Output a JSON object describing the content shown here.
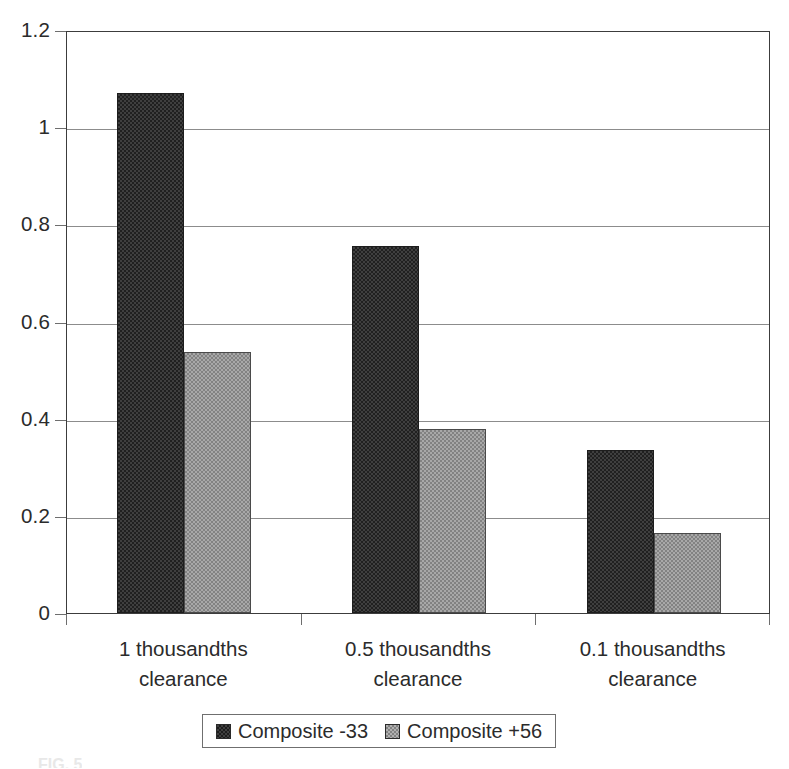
{
  "chart_data": {
    "type": "bar",
    "title": "",
    "subtitle": "",
    "xlabel": "",
    "ylabel": "",
    "categories": [
      "1 thousandths clearance",
      "0.5 thousandths clearance",
      "0.1 thousandths clearance"
    ],
    "category_lines": [
      [
        "1 thousandths",
        "clearance"
      ],
      [
        "0.5 thousandths",
        "clearance"
      ],
      [
        "0.1 thousandths",
        "clearance"
      ]
    ],
    "series": [
      {
        "name": "Composite -33",
        "values": [
          1.07,
          0.755,
          0.335
        ],
        "color": "#3f3f3f",
        "pattern": "dark-checker"
      },
      {
        "name": "Composite +56",
        "values": [
          0.538,
          0.378,
          0.165
        ],
        "color": "#a8a8a8",
        "pattern": "light-checker"
      }
    ],
    "ylim": [
      0,
      1.2
    ],
    "yticks": [
      0,
      0.2,
      0.4,
      0.6,
      0.8,
      1,
      1.2
    ],
    "ytick_labels": [
      "0",
      "0.2",
      "0.4",
      "0.6",
      "0.8",
      "1",
      "1.2"
    ],
    "grid": true,
    "grid_axis": "y",
    "legend_position": "bottom",
    "frame": true
  },
  "legend": {
    "entries": [
      {
        "label": "Composite -33",
        "swatch": "dark"
      },
      {
        "label": "Composite +56",
        "swatch": "light"
      }
    ]
  },
  "caption": {
    "text": "FIG. 5"
  }
}
